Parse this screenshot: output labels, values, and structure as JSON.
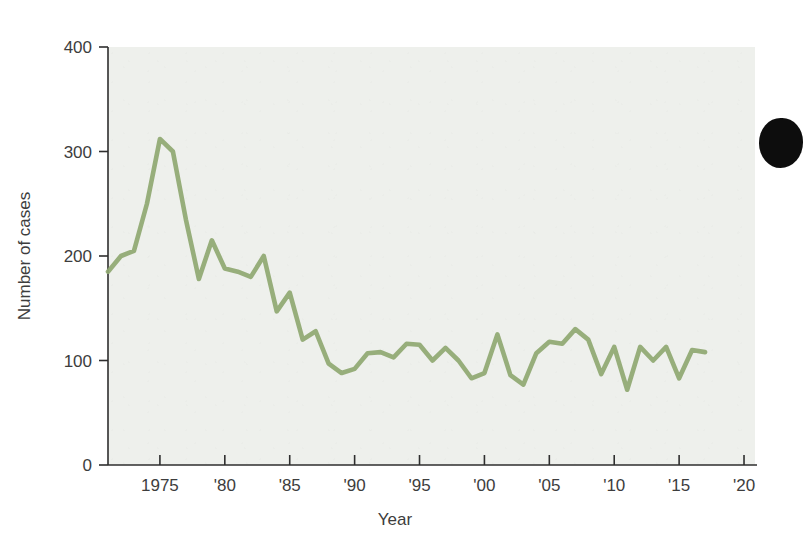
{
  "chart_data": {
    "type": "line",
    "title": "",
    "xlabel": "Year",
    "ylabel": "Number of cases",
    "xlim": [
      1971,
      2021
    ],
    "ylim": [
      0,
      400
    ],
    "grid": false,
    "legend": "none",
    "line_color": "#8fa871",
    "plot_background": "#eef0ec",
    "x_tick_values": [
      1975,
      1980,
      1985,
      1990,
      1995,
      2000,
      2005,
      2010,
      2015,
      2020
    ],
    "x_tick_labels": [
      "1975",
      "'80",
      "'85",
      "'90",
      "'95",
      "'00",
      "'05",
      "'10",
      "'15",
      "'20"
    ],
    "y_tick_values": [
      0,
      100,
      200,
      300,
      400
    ],
    "y_tick_labels": [
      "0",
      "100",
      "200",
      "300",
      "400"
    ],
    "x": [
      1971,
      1972,
      1973,
      1974,
      1975,
      1976,
      1977,
      1978,
      1979,
      1980,
      1981,
      1982,
      1983,
      1984,
      1985,
      1986,
      1987,
      1988,
      1989,
      1990,
      1991,
      1992,
      1993,
      1994,
      1995,
      1996,
      1997,
      1998,
      1999,
      2000,
      2001,
      2002,
      2003,
      2004,
      2005,
      2006,
      2007,
      2008,
      2009,
      2010,
      2011,
      2012,
      2013,
      2014,
      2015,
      2016,
      2017
    ],
    "values": [
      185,
      200,
      205,
      250,
      312,
      300,
      235,
      178,
      215,
      188,
      185,
      180,
      200,
      147,
      165,
      120,
      128,
      97,
      88,
      92,
      107,
      108,
      103,
      116,
      115,
      100,
      112,
      100,
      83,
      88,
      125,
      86,
      77,
      107,
      118,
      116,
      130,
      120,
      87,
      113,
      72,
      113,
      100,
      113,
      83,
      110,
      108
    ],
    "series_name": "Number of cases",
    "annotations": []
  },
  "axis": {
    "y_label": "Number of cases",
    "x_label": "Year"
  }
}
